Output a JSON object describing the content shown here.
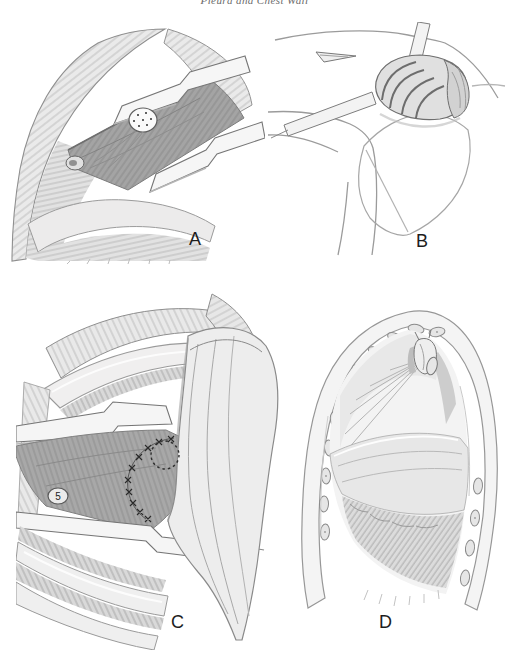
{
  "header": {
    "running_text": "Pleura and Chest Wall"
  },
  "figure": {
    "panels": [
      {
        "label": "A",
        "description": "Thoracotomy exposure: intercostal muscle flap raised between two rib retractors; divided rib end shown stippled"
      },
      {
        "label": "B",
        "description": "Posterior shoulder view: scapula outline with rolled muscle flap and tape emerging beside a small incision"
      },
      {
        "label": "C",
        "description": "Muscle flap passed into the chest and sutured around the defect (dotted circle) above the stump of rib 5"
      },
      {
        "label": "D",
        "description": "Parasagittal section of the hemithorax: transposed muscle flap filling the apical pleural space inside the cut rib arch"
      }
    ],
    "rib_stump_number": "5"
  },
  "colors": {
    "page_bg": "#ffffff",
    "label_text": "#1d1d1d",
    "header_text": "#6a6a6a",
    "pencil_line": "#8a8a8a"
  }
}
